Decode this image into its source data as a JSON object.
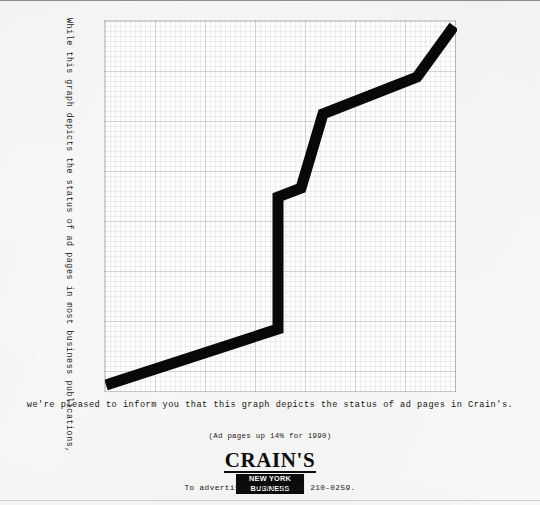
{
  "ad": {
    "vertical_caption": "While this graph depicts the status of ad pages in most business publications,",
    "bottom_caption": "we're pleased to inform you that this graph depicts the status of ad pages in Crain's.",
    "tagline": "(Ad pages up 14% for 1990)",
    "logo_wordmark": "CRAIN'S",
    "logo_subtitle": "NEW YORK BUSINESS",
    "advertise_line": "To advertise, call (212) 210-0259."
  },
  "colors": {
    "paper": "#f8f8f6",
    "ink": "#0b0b0b",
    "grid_minor": "rgba(130,145,165,0.13)",
    "grid_major": "rgba(120,135,155,0.26)"
  },
  "chart_data": {
    "type": "line",
    "title": "",
    "subtitle": "",
    "xlabel": "",
    "ylabel": "",
    "grid": true,
    "legend": null,
    "axis_labels_shown": false,
    "xlim": [
      0,
      352
    ],
    "ylim": [
      0,
      372
    ],
    "line_width_px": 11,
    "points_px": [
      [
        1,
        364
      ],
      [
        173,
        308
      ],
      [
        173,
        176
      ],
      [
        196,
        167
      ],
      [
        218,
        93
      ],
      [
        312,
        56
      ],
      [
        349,
        5
      ]
    ],
    "x": [
      0,
      49,
      49,
      56,
      62,
      89,
      99
    ],
    "values": [
      2,
      17,
      53,
      55,
      75,
      85,
      99
    ],
    "series": [
      {
        "name": "Crain's ad pages",
        "values": [
          2,
          17,
          53,
          55,
          75,
          85,
          99
        ]
      }
    ]
  }
}
